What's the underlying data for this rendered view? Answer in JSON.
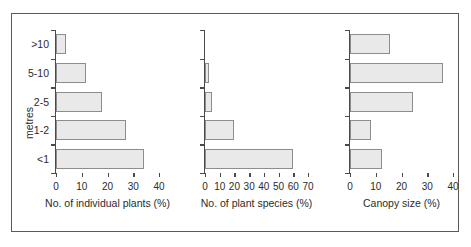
{
  "chart_data": [
    {
      "type": "bar",
      "orientation": "horizontal",
      "title": "",
      "xlabel": "No. of individual plants (%)",
      "ylabel": "metres",
      "categories": [
        ">10",
        "5-10",
        "2-5",
        "1-2",
        "<1"
      ],
      "values": [
        4,
        11.5,
        18,
        27,
        34
      ],
      "xlim": [
        0,
        40
      ],
      "xticks": [
        0,
        10,
        20,
        30,
        40
      ],
      "grid": false,
      "legend": false
    },
    {
      "type": "bar",
      "orientation": "horizontal",
      "title": "",
      "xlabel": "No. of plant species (%)",
      "ylabel": "",
      "categories": [
        ">10",
        "5-10",
        "2-5",
        "1-2",
        "<1"
      ],
      "values": [
        0,
        3,
        5,
        20,
        60
      ],
      "xlim": [
        0,
        70
      ],
      "xticks": [
        0,
        10,
        20,
        30,
        40,
        50,
        60,
        70
      ],
      "grid": false,
      "legend": false
    },
    {
      "type": "bar",
      "orientation": "horizontal",
      "title": "",
      "xlabel": "Canopy size (%)",
      "ylabel": "",
      "categories": [
        ">10",
        "5-10",
        "2-5",
        "1-2",
        "<1"
      ],
      "values": [
        15.5,
        36,
        24.5,
        8,
        12.5
      ],
      "xlim": [
        0,
        40
      ],
      "xticks": [
        0,
        10,
        20,
        30,
        40
      ],
      "grid": false,
      "legend": false
    }
  ],
  "style": {
    "bar_fill": "#e9e9e9",
    "bar_stroke": "#8d8d8d",
    "axis_color": "#4a4a4a",
    "frame_color": "#5a5a5a",
    "text_color": "#2b2b2b",
    "background": "#ffffff"
  }
}
